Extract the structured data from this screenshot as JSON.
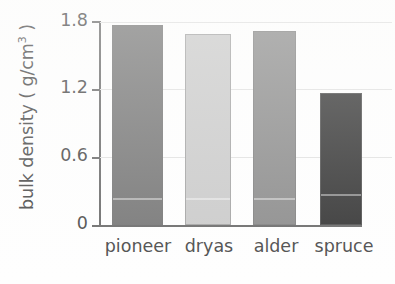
{
  "chart_data": {
    "type": "bar",
    "title": "",
    "subtitle": "",
    "xlabel": "",
    "ylabel": "bulk density (g/cm3)",
    "ylabel_prefix": "bulk density ( g/cm",
    "ylabel_exponent": "3",
    "ylabel_suffix": " )",
    "categories": [
      "pioneer",
      "dryas",
      "alder",
      "spruce"
    ],
    "values": [
      1.77,
      1.69,
      1.72,
      1.17
    ],
    "series": [
      {
        "name": "bulk density",
        "values": [
          1.77,
          1.69,
          1.72,
          1.17
        ]
      }
    ],
    "bar_colors": [
      "#7a7a7a",
      "#cccccc",
      "#8f8f8f",
      "#3a3a3a"
    ],
    "ylim": [
      0,
      1.8
    ],
    "yticks": [
      0,
      0.6,
      1.2,
      1.8
    ],
    "ytick_labels": [
      "0",
      "0.6",
      "1.2",
      "1.8"
    ],
    "xtick_labels": [
      "pioneer",
      "dryas",
      "alder",
      "spruce"
    ],
    "grid": "horizontal",
    "gridline_color": "#e2e2e2",
    "legend": "none",
    "legend_position": "none",
    "axis_color": "#6f6f6f",
    "text_color": "#4f4f4f",
    "background_color": "#ffffff",
    "annotations": []
  }
}
